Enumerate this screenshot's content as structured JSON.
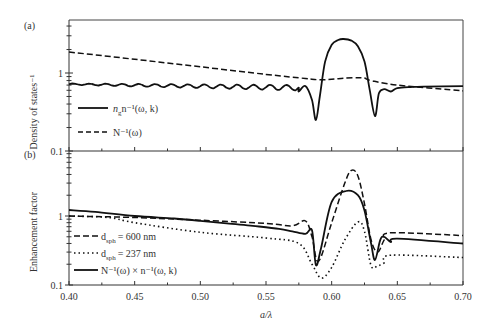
{
  "chart_data": [
    {
      "panel_label": "(a)",
      "type": "line",
      "title": "",
      "xlabel": "",
      "ylabel": "Density of states⁻¹",
      "yscale": "log",
      "ylim": [
        0.1,
        4.9
      ],
      "xlim": [
        0.4,
        0.7
      ],
      "yticks": [
        "0.1",
        "1"
      ],
      "grid": false,
      "legend_position": "lower-left",
      "series": [
        {
          "name": "n_g⁻¹(ω, k)",
          "style": "solid",
          "x": [
            0.4,
            0.42,
            0.44,
            0.46,
            0.48,
            0.5,
            0.52,
            0.54,
            0.56,
            0.57,
            0.575,
            0.58,
            0.585,
            0.588,
            0.591,
            0.595,
            0.6,
            0.605,
            0.609,
            0.615,
            0.62,
            0.625,
            0.629,
            0.633,
            0.636,
            0.64,
            0.645,
            0.65,
            0.66,
            0.67,
            0.7
          ],
          "y": [
            0.72,
            0.72,
            0.72,
            0.72,
            0.72,
            0.71,
            0.7,
            0.69,
            0.67,
            0.63,
            0.58,
            0.68,
            0.45,
            0.25,
            0.5,
            1.4,
            2.3,
            2.65,
            2.73,
            2.6,
            2.2,
            1.4,
            0.6,
            0.28,
            0.55,
            0.62,
            0.58,
            0.64,
            0.66,
            0.67,
            0.68
          ]
        },
        {
          "name": "N⁻¹(ω)",
          "style": "dashed",
          "x": [
            0.4,
            0.45,
            0.5,
            0.55,
            0.58,
            0.59,
            0.6,
            0.61,
            0.62,
            0.625,
            0.63,
            0.65,
            0.7
          ],
          "y": [
            1.86,
            1.5,
            1.2,
            0.96,
            0.85,
            0.82,
            0.83,
            0.86,
            0.87,
            0.86,
            0.8,
            0.7,
            0.59
          ]
        }
      ]
    },
    {
      "panel_label": "(b)",
      "type": "line",
      "title": "",
      "xlabel": "a/λ",
      "ylabel": "Enhancement factor",
      "yscale": "log",
      "ylim": [
        0.1,
        8.7
      ],
      "xlim": [
        0.4,
        0.7
      ],
      "xticks": [
        "0.40",
        "0.45",
        "0.50",
        "0.55",
        "0.60",
        "0.65",
        "0.70"
      ],
      "yticks": [
        "0.1",
        "1"
      ],
      "grid": false,
      "legend_position": "lower-left",
      "series": [
        {
          "name": "d_sph = 600 nm",
          "style": "dashed",
          "x": [
            0.4,
            0.45,
            0.5,
            0.55,
            0.57,
            0.58,
            0.585,
            0.59,
            0.6,
            0.61,
            0.615,
            0.62,
            0.625,
            0.63,
            0.635,
            0.64,
            0.645,
            0.7
          ],
          "y": [
            1.0,
            0.95,
            0.87,
            0.78,
            0.72,
            0.85,
            0.5,
            0.22,
            0.8,
            3.0,
            4.6,
            3.8,
            1.5,
            0.45,
            0.3,
            0.45,
            0.57,
            0.52
          ]
        },
        {
          "name": "d_sph = 237 nm",
          "style": "dotted",
          "x": [
            0.4,
            0.43,
            0.45,
            0.5,
            0.55,
            0.575,
            0.585,
            0.592,
            0.6,
            0.61,
            0.62,
            0.625,
            0.63,
            0.635,
            0.64,
            0.645,
            0.7
          ],
          "y": [
            1.0,
            0.95,
            0.8,
            0.58,
            0.48,
            0.4,
            0.2,
            0.126,
            0.18,
            0.45,
            0.82,
            0.6,
            0.19,
            0.19,
            0.21,
            0.27,
            0.25
          ]
        },
        {
          "name": "N⁻¹(ω) × n_g⁻¹(ω, k)",
          "style": "solid",
          "x": [
            0.4,
            0.42,
            0.45,
            0.48,
            0.5,
            0.52,
            0.54,
            0.56,
            0.57,
            0.58,
            0.585,
            0.588,
            0.592,
            0.6,
            0.611,
            0.62,
            0.625,
            0.63,
            0.633,
            0.637,
            0.64,
            0.645,
            0.65,
            0.7
          ],
          "y": [
            1.22,
            1.15,
            1.0,
            0.92,
            0.85,
            0.78,
            0.72,
            0.65,
            0.6,
            0.55,
            0.62,
            0.195,
            0.35,
            1.6,
            2.3,
            2.0,
            1.2,
            0.4,
            0.23,
            0.45,
            0.5,
            0.42,
            0.47,
            0.4
          ]
        }
      ]
    }
  ],
  "labels": {
    "panel_a": "(a)",
    "panel_b": "(b)",
    "ylabel_a": "Density of states⁻¹",
    "ylabel_b": "Enhancement factor",
    "xlabel": "a/λ",
    "ytick_a_1": "1",
    "ytick_a_01": "0.1",
    "ytick_b_1": "1",
    "ytick_b_01": "0.1",
    "xticks": [
      "0.40",
      "0.45",
      "0.50",
      "0.55",
      "0.60",
      "0.65",
      "0.70"
    ],
    "legend_a": [
      "n⁻¹(ω, k)",
      "N⁻¹(ω)"
    ],
    "legend_b": [
      "= 600 nm",
      "= 237 nm",
      "N⁻¹(ω) × n⁻¹(ω, k)"
    ],
    "legend_b_d": "d",
    "legend_b_sub": "sph",
    "legend_g_sub": "g"
  }
}
